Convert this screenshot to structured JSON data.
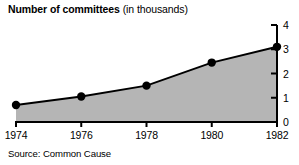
{
  "title": {
    "main": "Number of committees",
    "sub": "(in thousands)"
  },
  "source": "Source: Common Cause",
  "colors": {
    "area_fill": "#b5b5b5",
    "line": "#000000",
    "marker": "#000000",
    "axis": "#000000",
    "text": "#000000",
    "background": "#ffffff"
  },
  "chart_data": {
    "type": "area",
    "xlabel": "",
    "ylabel": "",
    "categories": [
      "1974",
      "1976",
      "1978",
      "1980",
      "1982"
    ],
    "x": [
      1974,
      1976,
      1978,
      1980,
      1982
    ],
    "values": [
      0.7,
      1.05,
      1.5,
      2.45,
      3.1
    ],
    "series": [
      {
        "name": "Number of committees",
        "values": [
          0.7,
          1.05,
          1.5,
          2.45,
          3.1
        ]
      }
    ],
    "xlim": [
      1974,
      1982
    ],
    "ylim": [
      0,
      4
    ],
    "yticks": [
      0,
      1,
      2,
      3,
      4
    ],
    "ytick_labels": [
      "0",
      "1",
      "2",
      "3",
      "4"
    ],
    "xticks": [
      1974,
      1976,
      1978,
      1980,
      1982
    ],
    "xtick_labels": [
      "1974",
      "1976",
      "1978",
      "1980",
      "1982"
    ],
    "y_axis_position": "right",
    "grid": false,
    "legend": false,
    "markers": true,
    "annotation": "Source: Common Cause"
  }
}
